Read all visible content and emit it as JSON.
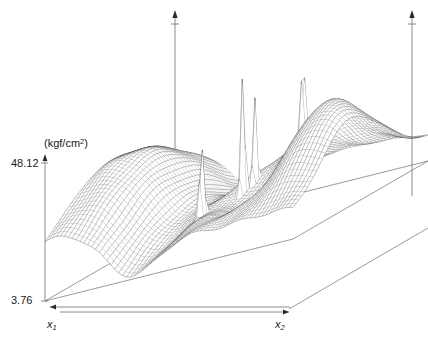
{
  "figure": {
    "type": "3d-surface-wireframe",
    "background": "#ffffff",
    "line_color": "#3a3a3a",
    "axis_color": "#6e6e6e"
  },
  "axes": {
    "vertical": {
      "name": "pressure",
      "unit_label": "(kgf/cm",
      "unit_sup": "2",
      "unit_close": ")",
      "max_label": "48.12",
      "min_label": "3.76",
      "max_value": 48.12,
      "min_value": 3.76,
      "pixel_top": 163,
      "pixel_bottom": 301,
      "pixel_x": 45
    },
    "x1": {
      "label": "x",
      "sub": "1"
    },
    "x2": {
      "label": "x",
      "sub": "2"
    }
  },
  "extra_axes": [
    {
      "name": "vertical-axis-mid",
      "x": 175,
      "y_top": 16,
      "y_bottom": 196
    },
    {
      "name": "vertical-axis-right",
      "x": 412,
      "y_top": 16,
      "y_bottom": 196
    }
  ],
  "chart_data": {
    "type": "surface",
    "title": "",
    "xlabel": "x1",
    "ylabel": "x2",
    "zlabel": "(kgf/cm^2)",
    "zlim": [
      3.76,
      48.12
    ],
    "grid": true,
    "legend": false,
    "nu": 64,
    "nv": 46,
    "projection": {
      "origin_x": 45,
      "origin_y": 301,
      "u_axis": [
        248,
        -62
      ],
      "v_axis": [
        135,
        -78
      ],
      "z_scale": 138
    },
    "base_plane": {
      "corners": [
        [
          45,
          301
        ],
        [
          293,
          239
        ],
        [
          428,
          161
        ],
        [
          180,
          223
        ]
      ],
      "visible_edges": [
        "front-left",
        "front-right"
      ]
    },
    "features": [
      {
        "kind": "plateau",
        "u": 0.1,
        "v": 0.5,
        "height": 0.62,
        "spread": 0.3
      },
      {
        "kind": "trough",
        "u": 0.34,
        "v": 0.5,
        "height": -0.34,
        "spread": 0.11
      },
      {
        "kind": "spike",
        "u": 0.47,
        "v": 0.3,
        "height": 0.52,
        "spread": 0.012
      },
      {
        "kind": "spike",
        "u": 0.545,
        "v": 0.46,
        "height": 1.0,
        "spread": 0.01
      },
      {
        "kind": "spike",
        "u": 0.56,
        "v": 0.52,
        "height": 0.86,
        "spread": 0.009
      },
      {
        "kind": "spike",
        "u": 0.7,
        "v": 0.62,
        "height": 0.7,
        "spread": 0.012
      },
      {
        "kind": "basin",
        "u": 0.66,
        "v": 0.4,
        "height": -0.26,
        "spread": 0.1
      },
      {
        "kind": "hill",
        "u": 0.82,
        "v": 0.55,
        "height": 0.46,
        "spread": 0.16
      },
      {
        "kind": "hill",
        "u": 0.95,
        "v": 0.35,
        "height": 0.3,
        "spread": 0.14
      }
    ]
  }
}
